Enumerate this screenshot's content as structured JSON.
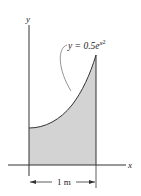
{
  "figure": {
    "axes": {
      "x_label": "x",
      "y_label": "y"
    },
    "curve": {
      "equation_prefix": "y = 0.5",
      "equation_base": "e",
      "equation_exponent": "x",
      "equation_exponent_power": "2"
    },
    "dimension": {
      "label": "1 m"
    },
    "colors": {
      "shading": "#d3d3d3",
      "lines": "#333333"
    }
  }
}
